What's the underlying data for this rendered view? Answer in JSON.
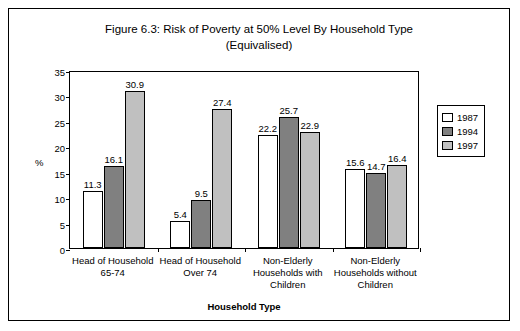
{
  "chart_data": {
    "type": "bar",
    "title": "Figure 6.3: Risk of Poverty at 50% Level By Household Type (Equivalised)",
    "title_line1": "Figure 6.3: Risk of Poverty at 50% Level By Household Type",
    "title_line2": "(Equivalised)",
    "xlabel": "Household Type",
    "ylabel": "%",
    "ylim": [
      0,
      35
    ],
    "yticks": [
      0,
      5,
      10,
      15,
      20,
      25,
      30,
      35
    ],
    "grid": false,
    "legend_position": "right",
    "categories": [
      "Head of Household 65-74",
      "Head of Household Over 74",
      "Non-Elderly Households with Children",
      "Non-Elderly Households without Children"
    ],
    "category_lines": [
      [
        "Head of Household",
        "65-74"
      ],
      [
        "Head of Household",
        "Over 74"
      ],
      [
        "Non-Elderly",
        "Households with",
        "Children"
      ],
      [
        "Non-Elderly",
        "Households without",
        "Children"
      ]
    ],
    "series": [
      {
        "name": "1987",
        "color": "#ffffff",
        "values": [
          11.3,
          5.4,
          22.2,
          15.6
        ],
        "labels": [
          "11.3",
          "5.4",
          "22.2",
          "15.6"
        ]
      },
      {
        "name": "1994",
        "color": "#808080",
        "values": [
          16.1,
          9.5,
          25.7,
          14.7
        ],
        "labels": [
          "16.1",
          "9.5",
          "25.7",
          "14.7"
        ]
      },
      {
        "name": "1997",
        "color": "#c0c0c0",
        "values": [
          30.9,
          27.4,
          22.9,
          16.4
        ],
        "labels": [
          "30.9",
          "27.4",
          "22.9",
          "16.4"
        ]
      }
    ]
  }
}
